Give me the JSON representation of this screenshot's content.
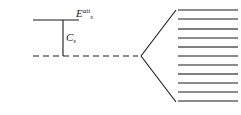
{
  "diagram": {
    "type": "energy-level-diagram",
    "width": 241,
    "height": 115,
    "background_color": "#ffffff",
    "line_color": "#1a1a1a",
    "labels": {
      "attachment_energy": {
        "base": "E",
        "subscript": "s",
        "superscript": "att",
        "full_text": "E_s^att"
      },
      "continuum": {
        "base": "C",
        "subscript": "s",
        "full_text": "C_s"
      }
    },
    "left_block": {
      "ground_level_line": {
        "name": "solid-horizontal-level",
        "x1": 33,
        "x2": 79,
        "y": 20,
        "style": "solid",
        "stroke_width": 1.1
      },
      "gap_bracket_line": {
        "name": "vertical-gap-line",
        "x": 63,
        "y1": 20,
        "y2": 56,
        "style": "solid",
        "stroke_width": 1.1
      },
      "threshold_line": {
        "name": "dashed-threshold-line",
        "x1": 33,
        "x2": 138,
        "y": 56,
        "style": "dashed",
        "dash_pattern": "6 4",
        "stroke_width": 1.1
      }
    },
    "fan": {
      "name": "fan-bracket",
      "apex_x": 141,
      "apex_y": 56,
      "top_x": 176,
      "top_y": 10,
      "bottom_x": 176,
      "bottom_y": 102,
      "stroke_width": 1.1
    },
    "level_stack": {
      "name": "split-level-stack",
      "x1": 178,
      "x2": 238,
      "count": 11,
      "levels": [
        {
          "index": 1,
          "y": 10,
          "stroke_width": 1.2,
          "color": "#1a1a1a"
        },
        {
          "index": 2,
          "y": 19,
          "stroke_width": 1.2,
          "color": "#1a1a1a"
        },
        {
          "index": 3,
          "y": 29,
          "stroke_width": 1.5,
          "color": "#555555"
        },
        {
          "index": 4,
          "y": 38,
          "stroke_width": 1.2,
          "color": "#1a1a1a"
        },
        {
          "index": 5,
          "y": 47,
          "stroke_width": 1.5,
          "color": "#555555"
        },
        {
          "index": 6,
          "y": 56,
          "stroke_width": 1.2,
          "color": "#1a1a1a"
        },
        {
          "index": 7,
          "y": 65,
          "stroke_width": 1.2,
          "color": "#1a1a1a"
        },
        {
          "index": 8,
          "y": 74,
          "stroke_width": 1.5,
          "color": "#555555"
        },
        {
          "index": 9,
          "y": 83,
          "stroke_width": 1.2,
          "color": "#1a1a1a"
        },
        {
          "index": 10,
          "y": 92,
          "stroke_width": 1.5,
          "color": "#666666"
        },
        {
          "index": 11,
          "y": 101,
          "stroke_width": 1.2,
          "color": "#1a1a1a"
        }
      ]
    }
  }
}
